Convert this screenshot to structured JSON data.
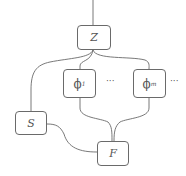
{
  "diagram": {
    "type": "graphical-model",
    "nodes": [
      {
        "id": "Z",
        "label": "Z",
        "x": 77,
        "y": 25,
        "w": 34,
        "h": 25
      },
      {
        "id": "phi1",
        "label": "ϕ",
        "subscript": "1",
        "x": 63,
        "y": 69,
        "w": 33,
        "h": 29
      },
      {
        "id": "phim",
        "label": "ϕ",
        "subscript": "m",
        "x": 133,
        "y": 69,
        "w": 33,
        "h": 29
      },
      {
        "id": "S",
        "label": "S",
        "x": 15,
        "y": 111,
        "w": 32,
        "h": 24
      },
      {
        "id": "F",
        "label": "F",
        "x": 97,
        "y": 141,
        "w": 32,
        "h": 25
      }
    ],
    "ellipses": [
      {
        "text": "···",
        "x": 106,
        "y": 78
      },
      {
        "text": "···",
        "x": 170,
        "y": 78
      }
    ],
    "edges": [
      {
        "from": "top",
        "to": "Z"
      },
      {
        "from": "Z",
        "to": "S"
      },
      {
        "from": "Z",
        "to": "phi1"
      },
      {
        "from": "Z",
        "to": "phim"
      },
      {
        "from": "phi1",
        "to": "F"
      },
      {
        "from": "phim",
        "to": "F"
      },
      {
        "from": "S",
        "to": "F"
      }
    ],
    "colors": {
      "stroke": "#6a6a6a",
      "text": "#555555",
      "background": "#ffffff"
    }
  }
}
